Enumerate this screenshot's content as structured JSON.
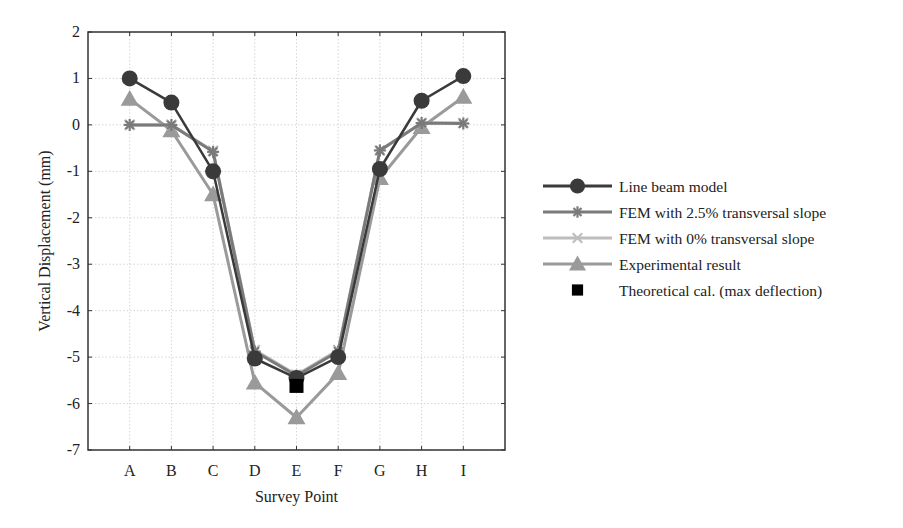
{
  "chart_data": {
    "type": "line",
    "title": "",
    "xlabel": "Survey Point",
    "ylabel": "Vertical Displacement (mm)",
    "categories": [
      "A",
      "B",
      "C",
      "D",
      "E",
      "F",
      "G",
      "H",
      "I"
    ],
    "ylim": [
      -7,
      2
    ],
    "yticks": [
      2,
      1,
      0,
      -1,
      -2,
      -3,
      -4,
      -5,
      -6,
      -7
    ],
    "grid": true,
    "legend_position": "right",
    "series": [
      {
        "name": "Line beam model",
        "marker": "circle",
        "color": "#3a3a3a",
        "values": [
          1.0,
          0.48,
          -1.0,
          -5.03,
          -5.45,
          -5.0,
          -0.95,
          0.52,
          1.05
        ]
      },
      {
        "name": "FEM with 2.5% transversal slope",
        "marker": "asterisk",
        "color": "#7a7a7a",
        "values": [
          0.0,
          0.0,
          -0.58,
          -4.88,
          -5.4,
          -4.88,
          -0.55,
          0.04,
          0.03
        ]
      },
      {
        "name": "FEM with 0% transversal slope",
        "marker": "x",
        "color": "#bdbdbd",
        "values": [
          0.0,
          0.0,
          -0.56,
          -4.85,
          -5.38,
          -4.85,
          -0.55,
          0.04,
          0.04
        ]
      },
      {
        "name": "Experimental result",
        "marker": "triangle",
        "color": "#9a9a9a",
        "values": [
          0.56,
          -0.12,
          -1.5,
          -5.55,
          -6.3,
          -5.35,
          -1.15,
          -0.05,
          0.6
        ]
      },
      {
        "name": "Theoretical cal. (max deflection)",
        "marker": "square",
        "color": "#000000",
        "values": [
          null,
          null,
          null,
          null,
          -5.62,
          null,
          null,
          null,
          null
        ]
      }
    ]
  },
  "legend": {
    "items": [
      "Line beam model",
      "FEM with 2.5% transversal slope",
      "FEM with 0% transversal slope",
      "Experimental result",
      "Theoretical cal. (max deflection)"
    ]
  },
  "axes": {
    "xlabel": "Survey Point",
    "ylabel": "Vertical Displacement (mm)"
  }
}
